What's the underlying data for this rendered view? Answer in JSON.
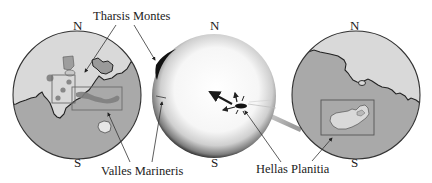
{
  "figure": {
    "colors": {
      "highland_light": "#d9d9d9",
      "lowland_mid": "#a9a9a9",
      "outline": "#2a2a2a",
      "box": "#6a6a6a",
      "dark_feature": "#7c7c7c",
      "globe_rim": "#9a9a9a",
      "background": "#ffffff"
    }
  },
  "labels": {
    "tharsis": "Tharsis Montes",
    "valles": "Valles Marineris",
    "hellas": "Hellas Planitia"
  },
  "globes": [
    {
      "id": "left",
      "north": "N",
      "south": "S",
      "features": [
        "Tharsis Montes",
        "Valles Marineris"
      ]
    },
    {
      "id": "center",
      "north": "N",
      "south": "S",
      "features": [
        "impact shockwave arrows",
        "Tharsis bulge"
      ]
    },
    {
      "id": "right",
      "north": "N",
      "south": "S",
      "features": [
        "Hellas Planitia"
      ]
    }
  ]
}
